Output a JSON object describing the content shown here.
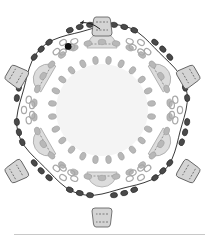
{
  "diagram": {
    "type": "beadwork-pattern",
    "center": [
      102,
      110
    ],
    "colors": {
      "background": "#ffffff",
      "center_fill": "#f4f4f4",
      "light_bead": "#b8b8b8",
      "light_bead_stroke": "#9a9a9a",
      "ring_bead_stroke": "#a8a8a8",
      "dark_bead": "#4a4a4a",
      "dark_bead_stroke": "#222222",
      "black_bead": "#111111",
      "semicircle_fill": "#dcdcdc",
      "drop_fill": "#d4d4d4",
      "thread": "#222222",
      "rule": "#c8c8c8"
    },
    "drops": [
      {
        "x": 102,
        "y": 26,
        "angle": 0
      },
      {
        "x": 189,
        "y": 76,
        "angle": 60
      },
      {
        "x": 189,
        "y": 172,
        "angle": 120
      },
      {
        "x": 102,
        "y": 218,
        "angle": 180
      },
      {
        "x": 16,
        "y": 172,
        "angle": 240
      },
      {
        "x": 16,
        "y": 76,
        "angle": 300
      }
    ],
    "arrow": {
      "direction": "left",
      "x": 80,
      "y": 23
    }
  }
}
